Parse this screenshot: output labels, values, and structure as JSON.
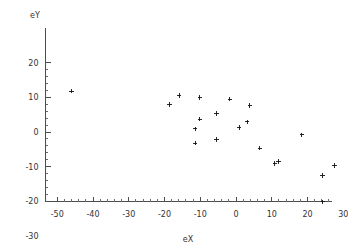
{
  "chart_data": {
    "type": "scatter",
    "title": "",
    "xlabel": "eX",
    "ylabel": "eY",
    "xlim": [
      -52,
      31
    ],
    "ylim": [
      -31,
      21
    ],
    "xticks": [
      -50,
      -40,
      -30,
      -20,
      -10,
      0,
      10,
      20,
      30
    ],
    "yticks": [
      20,
      10,
      0,
      -10,
      -20,
      -30
    ],
    "xtick_labels": [
      "-50",
      "-40",
      "-30",
      "-20",
      "-10",
      "0",
      "10",
      "20",
      "30"
    ],
    "ytick_labels": [
      "20",
      "10",
      "0",
      "-10",
      "-20",
      "-30"
    ],
    "minor_tick_step": 2,
    "grid": false,
    "legend": null,
    "marker": "plus",
    "marker_color": "#111111",
    "points": [
      {
        "x": -46.0,
        "y": 11.8
      },
      {
        "x": -18.6,
        "y": 7.9
      },
      {
        "x": -15.9,
        "y": 10.6
      },
      {
        "x": -11.4,
        "y": 0.9
      },
      {
        "x": -11.4,
        "y": -3.2
      },
      {
        "x": -10.1,
        "y": 10.0
      },
      {
        "x": -10.1,
        "y": 3.7
      },
      {
        "x": -5.5,
        "y": 5.3
      },
      {
        "x": -5.5,
        "y": -2.2
      },
      {
        "x": -1.7,
        "y": 9.5
      },
      {
        "x": 0.9,
        "y": 1.3
      },
      {
        "x": 3.1,
        "y": 2.9
      },
      {
        "x": 3.9,
        "y": 7.7
      },
      {
        "x": 6.7,
        "y": -4.7
      },
      {
        "x": 10.9,
        "y": -9.1
      },
      {
        "x": 11.9,
        "y": -8.5
      },
      {
        "x": 18.4,
        "y": -0.8
      },
      {
        "x": 24.2,
        "y": -12.6
      },
      {
        "x": 24.3,
        "y": -20.2
      },
      {
        "x": 27.6,
        "y": -9.7
      }
    ]
  },
  "axis": {
    "y_label": "eY",
    "x_label": "eX"
  }
}
